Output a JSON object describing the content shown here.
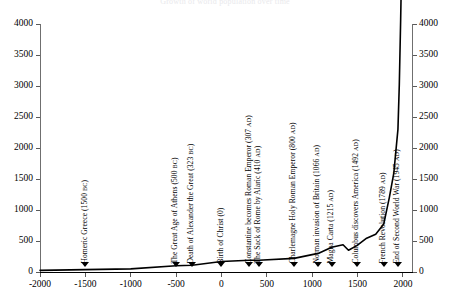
{
  "chart": {
    "title": "Growth of world population over time",
    "type": "line"
  },
  "axes": {
    "x": {
      "label": "",
      "ticks": [
        "-2000",
        "-1500",
        "-1000",
        "-500",
        "0",
        "500",
        "1000",
        "1500",
        "2000"
      ],
      "values": [
        -2000,
        -1500,
        -1000,
        -500,
        0,
        500,
        1000,
        1500,
        2000
      ],
      "min": -2000,
      "max": 2100
    },
    "y_left": {
      "label": "",
      "ticks": [
        "0",
        "500",
        "1000",
        "1500",
        "2000",
        "2500",
        "3000",
        "3500",
        "4000"
      ],
      "values": [
        0,
        500,
        1000,
        1500,
        2000,
        2500,
        3000,
        3500,
        4000
      ],
      "min": 0,
      "max": 4000
    },
    "y_right": {
      "label": "",
      "ticks": [
        "0",
        "500",
        "1000",
        "1500",
        "2000",
        "2500",
        "3000",
        "3500",
        "4000"
      ],
      "values": [
        0,
        500,
        1000,
        1500,
        2000,
        2500,
        3000,
        3500,
        4000
      ],
      "min": 0,
      "max": 4000
    }
  },
  "events": [
    {
      "name": "homeric-greece",
      "text": "Homeric Greece (1500 ",
      "era": "BC",
      "tail": ")",
      "year": -1500
    },
    {
      "name": "great-age-athens",
      "text": "The Great Age of Athens (500 ",
      "era": "BC",
      "tail": ")",
      "year": -500
    },
    {
      "name": "death-of-alexander",
      "text": "Death of Alexander the Great (323 ",
      "era": "BC",
      "tail": ")",
      "year": -323
    },
    {
      "name": "birth-of-christ",
      "text": "Birth of Christ (0)",
      "era": "",
      "tail": "",
      "year": 0
    },
    {
      "name": "constantine-emperor",
      "text": "Constantine becomes Roman Emperor (307 ",
      "era": "AD",
      "tail": ")",
      "year": 307
    },
    {
      "name": "sack-of-rome",
      "text": "The Sack of Rome by Alaric (410 ",
      "era": "AD",
      "tail": ")",
      "year": 410
    },
    {
      "name": "charlemagne",
      "text": "Charlemagne Holy Roman Emperor (800 ",
      "era": "AD",
      "tail": ")",
      "year": 800
    },
    {
      "name": "norman-invasion",
      "text": "Norman invasion of Britain (1066 ",
      "era": "AD",
      "tail": ")",
      "year": 1066
    },
    {
      "name": "magna-carta",
      "text": "Magna Carta (1215 ",
      "era": "AD",
      "tail": ")",
      "year": 1215
    },
    {
      "name": "columbus-america",
      "text": "Columbus discovers America (1492 ",
      "era": "AD",
      "tail": ")",
      "year": 1492
    },
    {
      "name": "french-revolution",
      "text": "French Revolution (1789 ",
      "era": "AD",
      "tail": ")",
      "year": 1789
    },
    {
      "name": "end-second-world-war",
      "text": "End of Second World War (1945 ",
      "era": "AD",
      "tail": ")",
      "year": 1945
    }
  ],
  "chart_data": {
    "type": "line",
    "title": "Growth of world population over time",
    "xlabel": "",
    "ylabel": "",
    "xlim": [
      -2000,
      2100
    ],
    "ylim": [
      0,
      4000
    ],
    "grid": false,
    "legend": "none",
    "series": [
      {
        "name": "World population (millions)",
        "x": [
          -2000,
          -1500,
          -1000,
          -500,
          -323,
          0,
          307,
          410,
          800,
          1066,
          1215,
          1340,
          1400,
          1492,
          1600,
          1700,
          1789,
          1850,
          1900,
          1930,
          1945,
          1960,
          1975,
          1990,
          2000
        ],
        "values": [
          27,
          38,
          50,
          100,
          110,
          170,
          190,
          190,
          220,
          300,
          400,
          440,
          350,
          425,
          545,
          610,
          775,
          1200,
          1600,
          2070,
          2300,
          3020,
          4070,
          5300,
          6100
        ]
      }
    ],
    "annotations": [
      {
        "label": "Homeric Greece (1500 BC)",
        "x": -1500,
        "y": 0
      },
      {
        "label": "The Great Age of Athens (500 BC)",
        "x": -500,
        "y": 0
      },
      {
        "label": "Death of Alexander the Great (323 BC)",
        "x": -323,
        "y": 0
      },
      {
        "label": "Birth of Christ (0)",
        "x": 0,
        "y": 0
      },
      {
        "label": "Constantine becomes Roman Emperor (307 AD)",
        "x": 307,
        "y": 0
      },
      {
        "label": "The Sack of Rome by Alaric (410 AD)",
        "x": 410,
        "y": 0
      },
      {
        "label": "Charlemagne Holy Roman Emperor (800 AD)",
        "x": 800,
        "y": 0
      },
      {
        "label": "Norman invasion of Britain (1066 AD)",
        "x": 1066,
        "y": 0
      },
      {
        "label": "Magna Carta (1215 AD)",
        "x": 1215,
        "y": 0
      },
      {
        "label": "Columbus discovers America (1492 AD)",
        "x": 1492,
        "y": 0
      },
      {
        "label": "French Revolution (1789 AD)",
        "x": 1789,
        "y": 0
      },
      {
        "label": "End of Second World War (1945 AD)",
        "x": 1945,
        "y": 0
      }
    ]
  }
}
